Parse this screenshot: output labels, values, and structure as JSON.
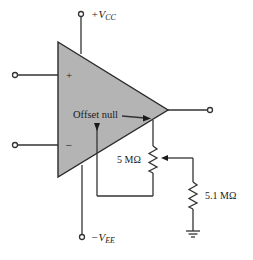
{
  "diagram": {
    "type": "op-amp offset null circuit",
    "colors": {
      "amp_fill": "#b4b4b4",
      "line": "#333333",
      "text": "#1a1a1a"
    },
    "opamp": {
      "plus_sign": "+",
      "minus_sign": "−"
    },
    "supply": {
      "positive_sign": "+V",
      "positive_sub": "CC",
      "negative_sign": "−V",
      "negative_sub": "EE"
    },
    "labels": {
      "offset_null": "Offset null",
      "pot_value": "5 MΩ",
      "resistor_value": "5.1 MΩ"
    }
  }
}
